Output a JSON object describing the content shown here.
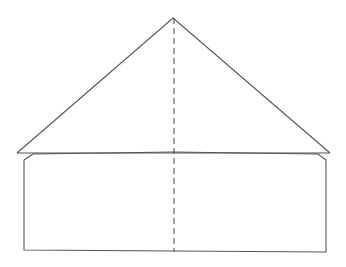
{
  "diagram": {
    "type": "origami-fold-step",
    "stroke_color": "#555555",
    "background": "#ffffff",
    "triangle": {
      "apex": [
        173,
        18
      ],
      "left": [
        17,
        153
      ],
      "right": [
        330,
        153
      ]
    },
    "base_line": {
      "from": [
        17,
        153
      ],
      "to": [
        330,
        153
      ]
    },
    "flap_edges": {
      "left": [
        [
          24,
          160
        ],
        [
          33,
          154
        ],
        [
          174,
          152
        ]
      ],
      "right": [
        [
          174,
          152
        ],
        [
          318,
          154
        ],
        [
          326,
          160
        ]
      ]
    },
    "rectangle": {
      "top_left": [
        24,
        160
      ],
      "top_right": [
        326,
        160
      ],
      "bottom_right": [
        326,
        252
      ],
      "bottom_left": [
        24,
        250
      ]
    },
    "center_fold_line": {
      "from": [
        174,
        18
      ],
      "to": [
        174,
        252
      ],
      "style": "dashed"
    }
  }
}
